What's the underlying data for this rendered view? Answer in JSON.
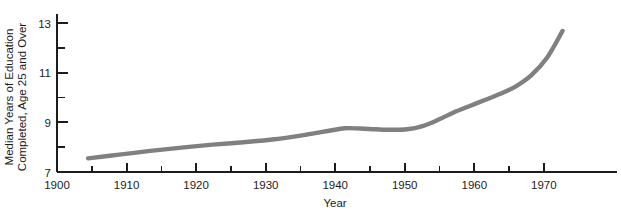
{
  "chart_data": {
    "type": "line",
    "title": "",
    "subtitle": "",
    "xlabel": "Year",
    "ylabel": "Median Years of Education Completed, Age 25 and Over",
    "ylabel_lines": [
      "Median Years of Education",
      "Completed, Age 25 and Over"
    ],
    "xlim": [
      1900,
      1972
    ],
    "ylim": [
      7,
      13
    ],
    "x_major_ticks": [
      1900,
      1910,
      1920,
      1930,
      1940,
      1950,
      1960,
      1970
    ],
    "x_major_tick_labels": [
      "1900",
      "1910",
      "1920",
      "1930",
      "1940",
      "1950",
      "1960",
      "1970"
    ],
    "x_minor_ticks": [
      1905,
      1915,
      1925,
      1935,
      1945,
      1955,
      1965
    ],
    "y_major_ticks": [
      7,
      9,
      11,
      13
    ],
    "y_major_tick_labels": [
      "7",
      "9",
      "11",
      "13"
    ],
    "y_minor_ticks": [
      8,
      10,
      12
    ],
    "grid": false,
    "legend": false,
    "legend_position": "none",
    "line_color": "#808080",
    "line_width": 4.4,
    "axis_color": "#1c1c1c",
    "background_color": "#ffffff",
    "series": [
      {
        "name": "Median years of education completed",
        "x": [
          1904,
          1908,
          1912,
          1916,
          1920,
          1924,
          1928,
          1932,
          1935,
          1937,
          1939,
          1941,
          1943,
          1945,
          1947,
          1949,
          1951,
          1953,
          1955,
          1957,
          1959,
          1961,
          1963,
          1965
        ],
        "values": [
          7.55,
          7.7,
          7.85,
          7.98,
          8.1,
          8.2,
          8.32,
          8.5,
          8.66,
          8.76,
          8.75,
          8.72,
          8.7,
          8.72,
          8.85,
          9.1,
          9.4,
          9.65,
          9.9,
          10.15,
          10.45,
          10.9,
          11.6,
          12.68
        ]
      }
    ]
  },
  "axes": {
    "x_title": "Year"
  }
}
